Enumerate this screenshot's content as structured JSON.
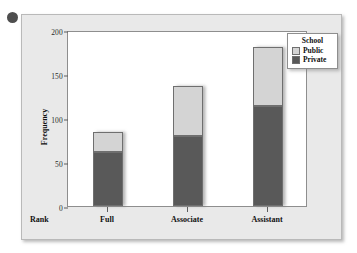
{
  "decor": {
    "bullet_icon": "filled-circle"
  },
  "chart_data": {
    "type": "bar",
    "subtype": "stacked-bar",
    "title": "",
    "xlabel": "Rank",
    "ylabel": "Frequency",
    "categories": [
      "Full",
      "Associate",
      "Assistant"
    ],
    "series": [
      {
        "name": "Private",
        "values": [
          61,
          79,
          114
        ],
        "color": "#595959"
      },
      {
        "name": "Public",
        "values": [
          23,
          57,
          67
        ],
        "color": "#d4d4d4"
      }
    ],
    "totals": [
      84,
      136,
      181
    ],
    "ylim": [
      0,
      200
    ],
    "yticks": [
      0,
      50,
      100,
      150,
      200
    ],
    "grid": false,
    "legend": {
      "title": "School",
      "position": "top-right",
      "entries": [
        {
          "label": "Public",
          "color": "#d4d4d4"
        },
        {
          "label": "Private",
          "color": "#595959"
        }
      ]
    }
  }
}
